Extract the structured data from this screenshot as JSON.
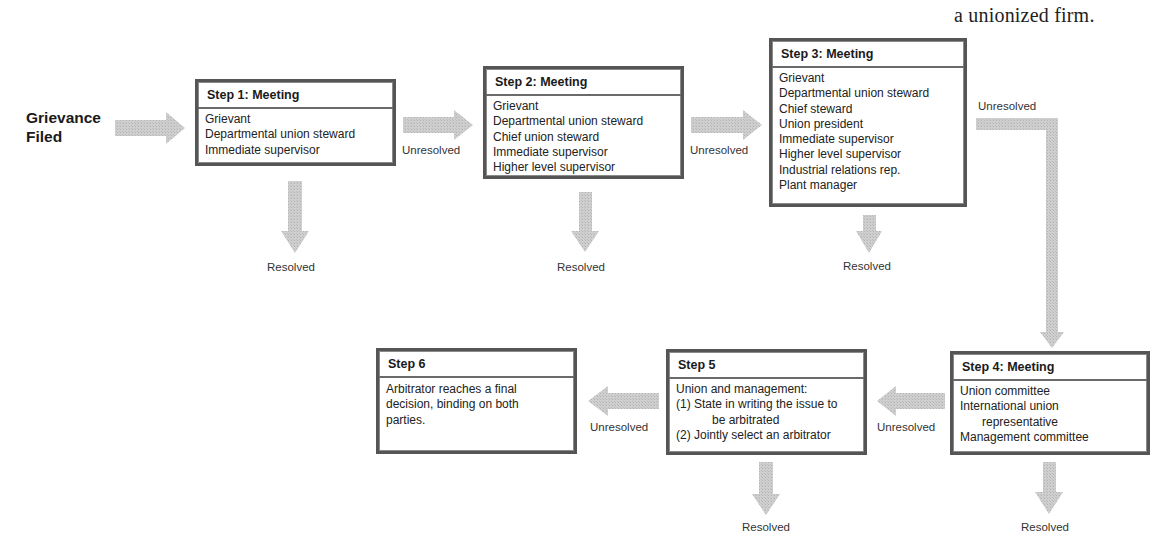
{
  "caption": {
    "line_partial": "g  p",
    "line": "a unionized firm."
  },
  "start": {
    "line1": "Grievance",
    "line2": "Filed"
  },
  "colors": {
    "arrow_fill": "#c4c4c4",
    "box_border": "#555555",
    "text": "#1a1a1a"
  },
  "steps": [
    {
      "title": "Step 1:  Meeting",
      "participants": [
        "Grievant",
        "Departmental union steward",
        "Immediate supervisor"
      ],
      "resolved_label": "Resolved",
      "unresolved_label": "Unresolved"
    },
    {
      "title": "Step 2:  Meeting",
      "participants": [
        "Grievant",
        "Departmental union steward",
        "Chief union steward",
        "Immediate supervisor",
        "Higher level supervisor"
      ],
      "resolved_label": "Resolved",
      "unresolved_label": "Unresolved"
    },
    {
      "title": "Step 3:  Meeting",
      "participants": [
        "Grievant",
        "Departmental union steward",
        "Chief steward",
        "Union president",
        "Immediate supervisor",
        "Higher level supervisor",
        "Industrial relations rep.",
        "Plant manager"
      ],
      "resolved_label": "Resolved",
      "unresolved_label": "Unresolved"
    },
    {
      "title": "Step 4:  Meeting",
      "participants": [
        "Union committee",
        "International union",
        "representative",
        "Management committee"
      ],
      "resolved_label": "Resolved",
      "unresolved_label": "Unresolved"
    },
    {
      "title": "Step 5",
      "participants": [
        "Union and management:",
        "(1) State in writing the issue to",
        "be arbitrated",
        "(2) Jointly select an arbitrator"
      ],
      "resolved_label": "Resolved",
      "unresolved_label": "Unresolved"
    },
    {
      "title": "Step 6",
      "participants": [
        "Arbitrator reaches a final",
        "decision, binding on both",
        "parties."
      ]
    }
  ]
}
